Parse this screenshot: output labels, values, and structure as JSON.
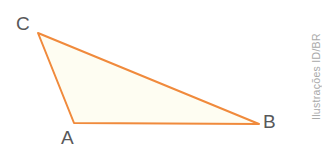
{
  "figure": {
    "type": "geometry-diagram",
    "shape": "triangle",
    "width": 327,
    "height": 154,
    "background_color": "#FFFFFF",
    "stroke_color": "#F08A3C",
    "fill_color": "#FEFDF2",
    "stroke_width": 2,
    "label_color": "#58585A",
    "vertices": [
      {
        "name": "C",
        "x": 38,
        "y": 33,
        "label": "C",
        "label_x": 16,
        "label_y": 14
      },
      {
        "name": "A",
        "x": 74,
        "y": 123,
        "label": "A",
        "label_x": 61,
        "label_y": 128
      },
      {
        "name": "B",
        "x": 259,
        "y": 124,
        "label": "B",
        "label_x": 263,
        "label_y": 112
      }
    ],
    "edges": [
      {
        "from": "C",
        "to": "A"
      },
      {
        "from": "A",
        "to": "B"
      },
      {
        "from": "B",
        "to": "C"
      }
    ],
    "polygon_points": "38,33 74,123 259,124"
  },
  "credit": {
    "text": "Ilustrações ID/BR",
    "color": "#A9A9A9",
    "orientation": "vertical-bottom-to-top"
  }
}
